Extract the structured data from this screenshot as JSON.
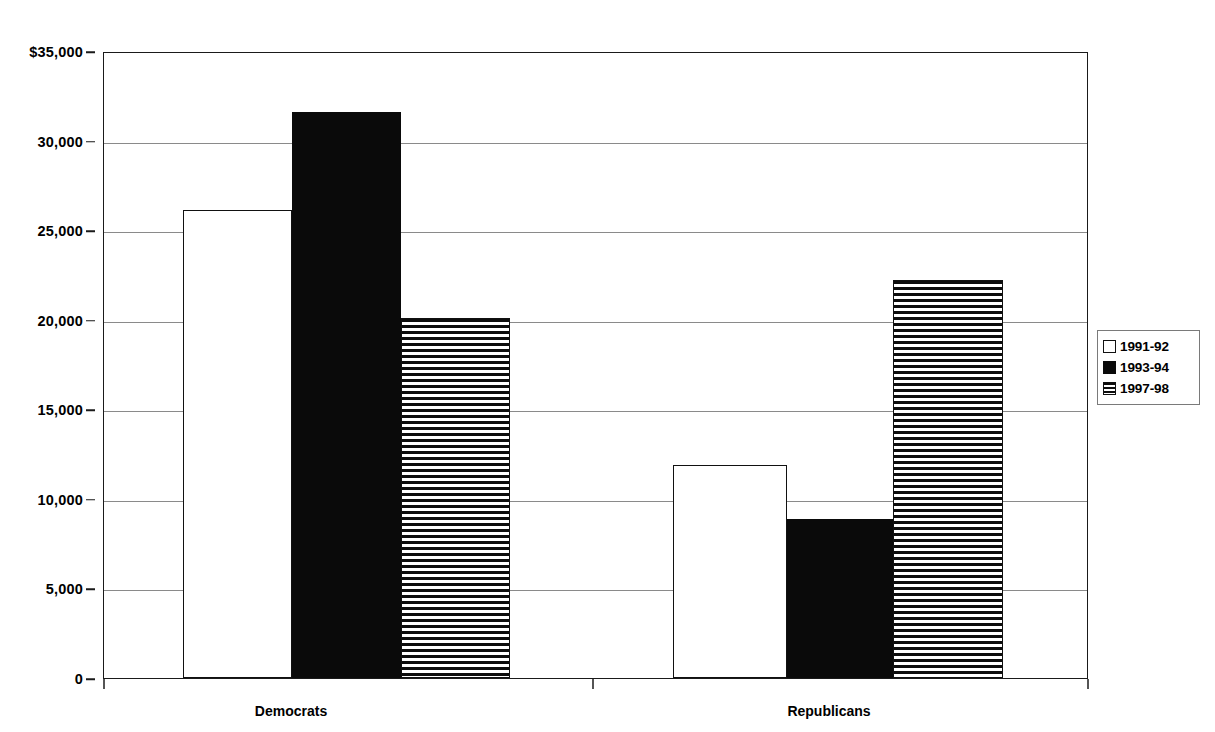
{
  "chart_data": {
    "type": "bar",
    "title": "",
    "subtitle": "",
    "xlabel": "",
    "ylabel": "",
    "categories": [
      "Democrats",
      "Republicans"
    ],
    "series": [
      {
        "name": "1991-92",
        "values": [
          26100,
          11900
        ],
        "fill": "open",
        "color": "#ffffff"
      },
      {
        "name": "1993-94",
        "values": [
          31600,
          8900
        ],
        "fill": "solid",
        "color": "#0a0a0a"
      },
      {
        "name": "1997-98",
        "values": [
          20100,
          22200
        ],
        "fill": "hstripe",
        "color": "#0d0d0d"
      }
    ],
    "ylim": [
      0,
      35000
    ],
    "yticks": [
      0,
      5000,
      10000,
      15000,
      20000,
      25000,
      30000,
      35000
    ],
    "ytick_labels": [
      "0",
      "5,000",
      "10,000",
      "15,000",
      "20,000",
      "25,000",
      "30,000",
      "$35,000"
    ],
    "grid": true,
    "grid_axis": "y",
    "legend_position": "right",
    "legend_entries": [
      "1991-92",
      "1993-94",
      "1997-98"
    ],
    "annotations": []
  },
  "axes": {
    "y_axis_name": "y-axis",
    "x_axis_name": "x-axis"
  },
  "legend": {
    "items": [
      {
        "label": "1991-92",
        "swatch": "open-square-swatch"
      },
      {
        "label": "1993-94",
        "swatch": "solid-square-swatch"
      },
      {
        "label": "1997-98",
        "swatch": "striped-square-swatch"
      }
    ]
  }
}
